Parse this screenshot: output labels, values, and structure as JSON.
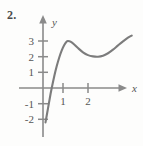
{
  "figure": {
    "exercise_number": "2.",
    "axis_labels": {
      "x": "x",
      "y": "y"
    },
    "colors": {
      "curve": "#7c7c7c",
      "axis": "#8a8a8a",
      "text": "#555555",
      "background": "#fdfdfc"
    }
  },
  "chart_data": {
    "type": "line",
    "title": "",
    "xlabel": "x",
    "ylabel": "y",
    "xlim": [
      -0.55,
      3.9
    ],
    "ylim": [
      -2.6,
      3.9
    ],
    "grid": false,
    "legend": null,
    "xticks": [
      1,
      2
    ],
    "xtick_labels": [
      "1",
      "2"
    ],
    "yticks": [
      -2,
      -1,
      1,
      2,
      3
    ],
    "ytick_labels": [
      "-2",
      "-1",
      "1",
      "2",
      "3"
    ],
    "annotations": [
      "local maximum near (1, 3)",
      "local minimum near (2.2, 2)",
      "x-intercept near x = 0.35"
    ],
    "series": [
      {
        "name": "f",
        "x": [
          0.1,
          0.2,
          0.3,
          0.35,
          0.45,
          0.55,
          0.65,
          0.75,
          0.85,
          0.95,
          1.0,
          1.1,
          1.25,
          1.4,
          1.6,
          1.8,
          2.0,
          2.2,
          2.4,
          2.6,
          2.8,
          3.0,
          3.2,
          3.4,
          3.55
        ],
        "y": [
          -2.2,
          -1.3,
          -0.4,
          0.0,
          0.75,
          1.4,
          1.95,
          2.4,
          2.75,
          2.97,
          3.0,
          2.96,
          2.78,
          2.55,
          2.28,
          2.1,
          2.02,
          2.0,
          2.06,
          2.22,
          2.45,
          2.72,
          2.98,
          3.22,
          3.35
        ]
      }
    ]
  }
}
